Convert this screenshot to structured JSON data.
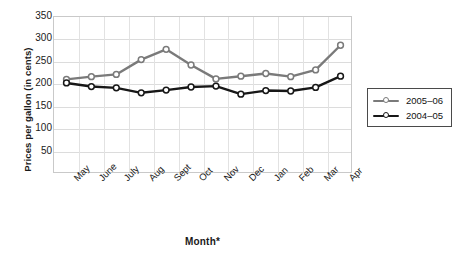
{
  "chart_data": {
    "type": "line",
    "title": "",
    "xlabel": "Month*",
    "ylabel": "Prices per gallon (in cents)",
    "categories": [
      "May",
      "June",
      "July",
      "Aug",
      "Sept",
      "Oct",
      "Nov",
      "Dec",
      "Jan",
      "Feb",
      "Mar",
      "Apr"
    ],
    "ylim": [
      0,
      350
    ],
    "yticks": [
      350,
      300,
      250,
      200,
      150,
      100,
      50
    ],
    "grid": true,
    "legend_position": "right",
    "series": [
      {
        "name": "2005–06",
        "color": "#7a7a7a",
        "marker": "open-circle",
        "values": [
          211,
          217,
          222,
          255,
          278,
          243,
          212,
          218,
          224,
          217,
          232,
          287
        ]
      },
      {
        "name": "2004–05",
        "color": "#171717",
        "marker": "open-circle",
        "values": [
          203,
          195,
          192,
          181,
          187,
          194,
          196,
          178,
          186,
          185,
          193,
          218
        ]
      }
    ]
  },
  "axes": {
    "y_title": "Prices per gallon (in cents)",
    "x_title": "Month*"
  },
  "legend": {
    "entries": [
      {
        "label": "2005–06"
      },
      {
        "label": "2004–05"
      }
    ]
  }
}
